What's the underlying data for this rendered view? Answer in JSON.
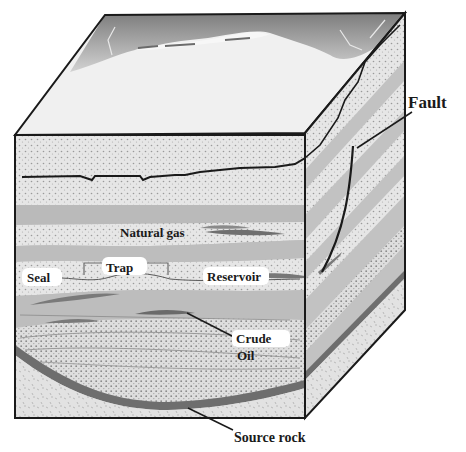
{
  "diagram": {
    "labels": {
      "fault": "Fault",
      "natural_gas": "Natural gas",
      "trap": "Trap",
      "seal": "Seal",
      "reservoir": "Reservoir",
      "crude": "Crude",
      "oil": "Oil",
      "source_rock": "Source rock"
    },
    "colors": {
      "outline": "#1a1a1a",
      "sand_layer": "#e4e4e4",
      "shale_layer": "#bdbdbd",
      "source_rock": "#6e6e6e",
      "hydrocarbon": "#7a7a7a",
      "surface": "#f0f0f0",
      "mountains": "#8c8c8c"
    }
  }
}
